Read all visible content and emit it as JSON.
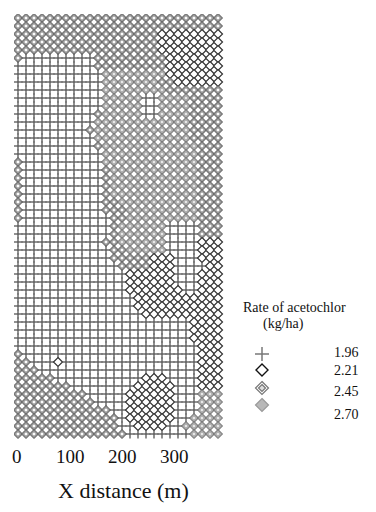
{
  "chart_data": {
    "type": "heatmap",
    "title": "",
    "xlabel": "X distance (m)",
    "ylabel": "",
    "x_ticks": [
      "0",
      "100",
      "200",
      "300"
    ],
    "xlim": [
      0,
      400
    ],
    "legend": {
      "title": "Rate of acetochlor",
      "subtitle": "(kg/ha)",
      "position": "right",
      "entries": [
        {
          "symbol": "plus",
          "value": "1.96"
        },
        {
          "symbol": "open-diamond",
          "value": "2.21"
        },
        {
          "symbol": "double-diamond",
          "value": "2.45"
        },
        {
          "symbol": "filled-diamond",
          "value": "2.70"
        }
      ]
    },
    "grid": {
      "cols": 26,
      "rows": 53,
      "classes": [
        "1.96",
        "2.21",
        "2.45",
        "2.70"
      ]
    },
    "zones": [
      "22222222222222222222222222",
      "22222222222222222222222222",
      "22222222222222222211111111",
      "22222222222222222211111111",
      "22222222222222222211111111",
      "20000000002222222221111111",
      "00000000002222222221111111",
      "00000000000333333331111111",
      "00000000000333333322111111",
      "00000000000333333332222222",
      "00000000000333330033332222",
      "00000000000333330033332222",
      "00000000002333330033332222",
      "00000000003333333333332222",
      "00000000023333333333332222",
      "00000000003333333333332222",
      "00000000002333333333333222",
      "00000000000333333333333222",
      "20000000000333333333333222",
      "20000000000233333333333222",
      "20000000000233333333333222",
      "20000000000233333333333222",
      "20000000000233333333333222",
      "20000000000223333333333222",
      "20000000000222333333333222",
      "20000000000022333333333222",
      "00000000000023333330000222",
      "00000000000023333330000222",
      "00000000000223333330000111",
      "00000000000022333330000111",
      "00000000000022222111000111",
      "00000000000002222111000011",
      "00000000000000111111000111",
      "00000000000000111111000111",
      "00000000000000111111100111",
      "00000000000000011111111111",
      "00000000000000011111111111",
      "00000000000000001111111111",
      "00000000000000000000001111",
      "00000000000000000000001111",
      "00000000000000000000001111",
      "00000000000000000000000111",
      "20000000000000000000000111",
      "22000100000000000000000111",
      "22200000000000000000000111",
      "22222000000000001110000111",
      "22222220000000011111000111",
      "22222222200000111111000333",
      "22222222220000111111000333",
      "22222222222200111111000333",
      "22222222222220111111003333",
      "22222222222220011110033333",
      "22222222222222000000003333"
    ]
  }
}
